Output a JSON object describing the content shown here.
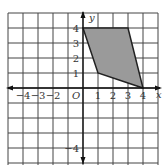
{
  "figure": {
    "type": "coordinate-grid",
    "x_axis_label": "x",
    "y_axis_label": "y",
    "origin_label": "O",
    "x_tick_labels": [
      {
        "value": -4,
        "label": "−4"
      },
      {
        "value": -3,
        "label": "−3"
      },
      {
        "value": -2,
        "label": "−2"
      },
      {
        "value": 1,
        "label": "1"
      },
      {
        "value": 2,
        "label": "2"
      },
      {
        "value": 3,
        "label": "3"
      },
      {
        "value": 4,
        "label": "4"
      }
    ],
    "y_tick_labels": [
      {
        "value": 4,
        "label": "4"
      },
      {
        "value": 3,
        "label": "3"
      },
      {
        "value": 2,
        "label": "2"
      },
      {
        "value": 1,
        "label": "1"
      },
      {
        "value": -4,
        "label": "−4"
      }
    ],
    "shape": {
      "name": "quadrilateral",
      "vertices": [
        [
          0,
          4
        ],
        [
          3,
          4
        ],
        [
          4,
          0
        ],
        [
          1,
          1
        ]
      ],
      "fill": "#9a9a9a",
      "stroke": "#222222"
    },
    "grid_color": "#444444"
  }
}
